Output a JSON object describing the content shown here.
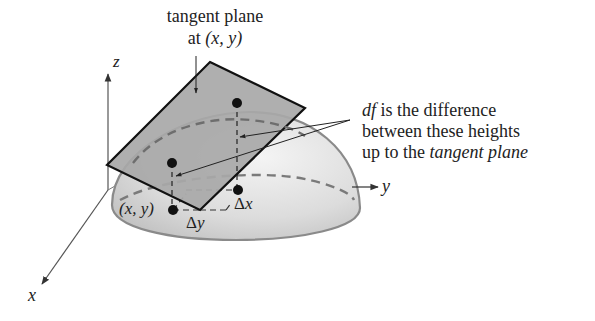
{
  "diagram": {
    "labels": {
      "tangent_plane_line1": "tangent plane",
      "tangent_plane_line2_prefix": "at ",
      "tangent_plane_point": "(x, y)",
      "annotation_df": "df",
      "annotation_line1_rest": " is the difference",
      "annotation_line2": "between these heights",
      "annotation_line3_prefix": "up to the ",
      "annotation_line3_italic": "tangent plane",
      "point_xy": "(x, y)",
      "delta_x": "Δx",
      "delta_y": "Δy"
    },
    "axes": {
      "x_label": "x",
      "y_label": "y",
      "z_label": "z"
    },
    "colors": {
      "plane_fill": "#a8a8a8",
      "plane_stroke": "#111111",
      "dome_fill_light": "#ececec",
      "dome_fill_dark": "#c8c8c8",
      "dome_stroke": "#8a8a8a",
      "dashed_curve": "#7a7a7a",
      "axis": "#555555",
      "dot": "#111111"
    }
  }
}
